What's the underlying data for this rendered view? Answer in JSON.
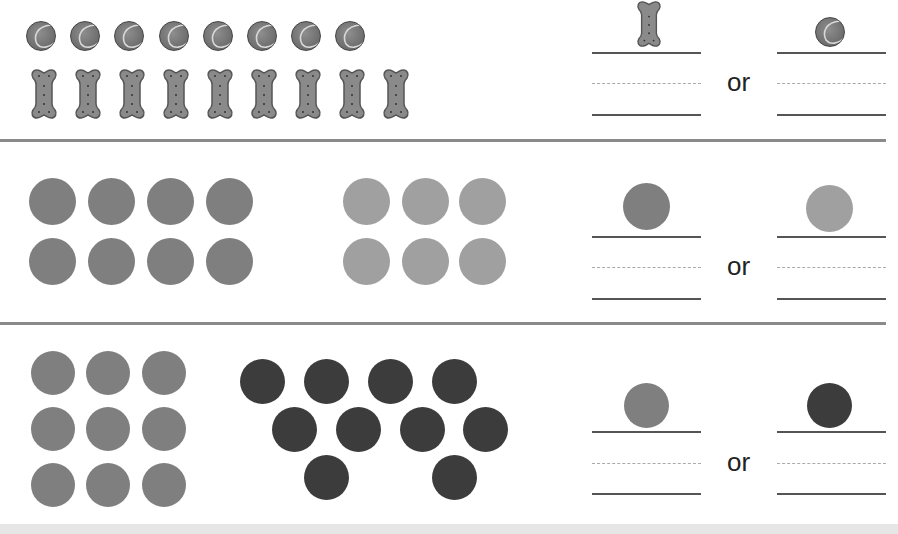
{
  "colors": {
    "rule": "#8a8a8a",
    "medium": "#7f7f7f",
    "light": "#a0a0a0",
    "dark": "#3c3c3c",
    "answer_line": "#555555",
    "dashed_line": "#aaaaaa"
  },
  "rows": [
    {
      "name": "tennis-balls-vs-bones",
      "group_a": {
        "item": "tennis-ball",
        "count": 8
      },
      "group_b": {
        "item": "dog-bone",
        "count": 9
      },
      "choice_left": "dog-bone",
      "choice_right": "tennis-ball",
      "or_label": "or"
    },
    {
      "name": "medium-vs-light-dots",
      "group_a": {
        "item": "medium-gray-dot",
        "count": 8
      },
      "group_b": {
        "item": "light-gray-dot",
        "count": 6
      },
      "choice_left": "medium-gray-dot",
      "choice_right": "light-gray-dot",
      "or_label": "or"
    },
    {
      "name": "medium-vs-dark-dots",
      "group_a": {
        "item": "medium-gray-dot",
        "count": 9
      },
      "group_b": {
        "item": "dark-gray-dot",
        "count": 10
      },
      "choice_left": "medium-gray-dot",
      "choice_right": "dark-gray-dot",
      "or_label": "or"
    }
  ]
}
